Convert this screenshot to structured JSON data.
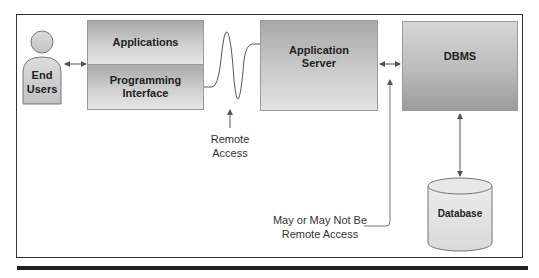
{
  "diagram": {
    "nodes": {
      "end_users": {
        "line1": "End",
        "line2": "Users"
      },
      "applications": {
        "label": "Applications"
      },
      "programming_interface": {
        "line1": "Programming",
        "line2": "Interface"
      },
      "application_server": {
        "line1": "Application",
        "line2": "Server"
      },
      "dbms": {
        "label": "DBMS"
      },
      "database": {
        "label": "Database"
      }
    },
    "annotations": {
      "remote_access": {
        "line1": "Remote",
        "line2": "Access"
      },
      "may_or_may_not": {
        "line1": "May or May Not Be",
        "line2": "Remote Access"
      }
    },
    "edges": [
      {
        "from": "end_users",
        "to": "applications",
        "type": "bidirectional"
      },
      {
        "from": "programming_interface",
        "to": "application_server",
        "type": "wave-link"
      },
      {
        "from": "application_server",
        "to": "dbms",
        "type": "bidirectional"
      },
      {
        "from": "dbms",
        "to": "database",
        "type": "bidirectional"
      }
    ],
    "colors": {
      "box_dark": "#a9a9a9",
      "box_light": "#e6e6e6",
      "line": "#666666",
      "frame": "#333333"
    }
  }
}
